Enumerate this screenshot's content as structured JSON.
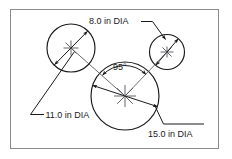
{
  "drawing": {
    "title": "Three tangent circles with diameter dimensions",
    "frame": {
      "x": 10,
      "y": 9,
      "width": 209,
      "height": 140,
      "stroke_color": "#8a8a8f",
      "fill_color": "#ffffff"
    },
    "line_color": "#1a1a1a",
    "center_mark_color": "#55555a",
    "labels": {
      "upper": "8.0 in DIA",
      "left": "11.0 in DIA",
      "lower_right": "15.0 in DIA",
      "angle": "95°"
    },
    "circles": [
      {
        "name": "left-circle",
        "label": "11.0 in DIA",
        "diameter_in": 11.0,
        "center_x": 71,
        "center_y": 48,
        "radius": 24
      },
      {
        "name": "right-circle",
        "label": "8.0 in DIA",
        "diameter_in": 8.0,
        "center_x": 167,
        "center_y": 52,
        "radius": 17.5
      },
      {
        "name": "bottom-circle",
        "label": "15.0 in DIA",
        "diameter_in": 15.0,
        "center_x": 125,
        "center_y": 96,
        "radius": 34
      }
    ],
    "angle": {
      "value": "95°",
      "vertex_x": 125,
      "vertex_y": 96,
      "arc_radius": 30
    }
  }
}
